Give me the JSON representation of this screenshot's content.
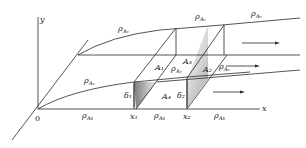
{
  "diagram": {
    "axes": {
      "y_label": "y",
      "x_label": "x",
      "origin_label": "0"
    },
    "labels": {
      "rho_A0": "ρ",
      "rho_A0_sub": "A₀",
      "rho_As": "ρ",
      "rho_As_sub": "As",
      "A1": "A₁",
      "A2": "A₂",
      "A3": "A₃",
      "A4": "A₄",
      "delta1": "δ₁",
      "delta2": "δ₂",
      "x1": "x₁",
      "x2": "x₂"
    },
    "flow_arrows": 3,
    "colors": {
      "line": "#2a2a2a",
      "shade_dark": "#8a8a8a",
      "shade_light": "#f2f2f2"
    }
  }
}
